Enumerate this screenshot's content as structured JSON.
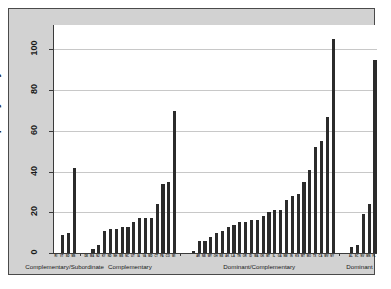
{
  "chart_data": {
    "type": "bar",
    "title": "",
    "xlabel": "",
    "ylabel": "Number of policy analysts",
    "ylim": [
      0,
      112
    ],
    "yticks": [
      0,
      20,
      40,
      60,
      80,
      100
    ],
    "ytick_labels": [
      "0",
      "20",
      "40",
      "60",
      "80",
      "100"
    ],
    "grid": true,
    "legend": "none",
    "bar_color": "#2b2b2b",
    "groups": [
      {
        "label": "Complementary/Subordinate",
        "categories": [
          "RI",
          "VT",
          "SD",
          "MS"
        ],
        "values": [
          0,
          9,
          10,
          42
        ]
      },
      {
        "label": "Complementary",
        "categories": [
          "DE",
          "MA",
          "NJ",
          "KY",
          "ND",
          "NH",
          "ME",
          "NC",
          "UT",
          "IA",
          "VA",
          "MD",
          "CT",
          "PA",
          "CO",
          "WI"
        ],
        "values": [
          0,
          2,
          4,
          11,
          12,
          12,
          13,
          13,
          15,
          17,
          17,
          17,
          24,
          34,
          35,
          70
        ]
      },
      {
        "label": "Dominant/Complementary",
        "categories": [
          "AR",
          "NE",
          "WY",
          "OH",
          "NE",
          "AK",
          "LA",
          "TN",
          "OR",
          "ID",
          "WA",
          "OK",
          "MT",
          "IL",
          "GA",
          "NM",
          "IN",
          "KS",
          "MT",
          "MO",
          "TX",
          "CA",
          "WV",
          "NY"
        ],
        "values": [
          0,
          1,
          6,
          6,
          8,
          10,
          11,
          13,
          14,
          15,
          15,
          16,
          16,
          18,
          20,
          21,
          21,
          26,
          28,
          29,
          35,
          41,
          52,
          55,
          67,
          105
        ]
      },
      {
        "label": "Dominant",
        "categories": [
          "AL",
          "SC",
          "NV",
          "MN",
          "FL"
        ],
        "values": [
          0,
          3,
          4,
          19,
          24,
          95
        ]
      }
    ]
  },
  "axes": {
    "y_title": "Number of policy analysts"
  }
}
